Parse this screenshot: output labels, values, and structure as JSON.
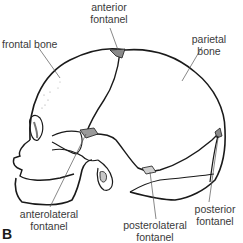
{
  "figure": {
    "panel_letter": "B",
    "labels": {
      "anterior_fontanel": [
        "anterior",
        "fontanel"
      ],
      "frontal_bone": [
        "frontal bone"
      ],
      "parietal_bone": [
        "parietal",
        "bone"
      ],
      "anterolateral_fontanel": [
        "anterolateral",
        "fontanel"
      ],
      "posterolateral_fontanel": [
        "posterolateral",
        "fontanel"
      ],
      "posterior_fontanel": [
        "posterior",
        "fontanel"
      ]
    }
  },
  "colors": {
    "line": "#1a1a1a",
    "leader": "#555555",
    "label_text": "#3a3a3a",
    "fontanel_fill": "#8a8a8a",
    "background": "#ffffff"
  }
}
